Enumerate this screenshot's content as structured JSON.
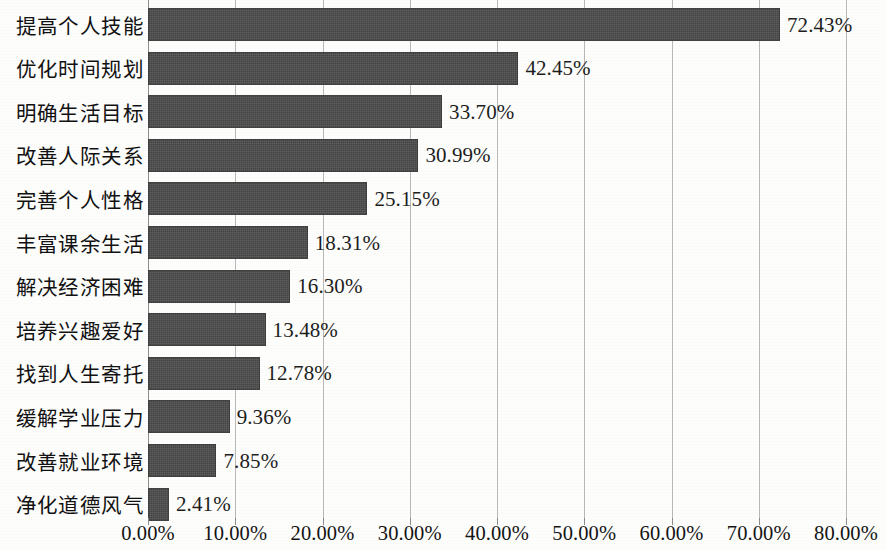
{
  "chart_data": {
    "type": "bar",
    "orientation": "horizontal",
    "title": "",
    "subtitle": "",
    "xlabel": "",
    "ylabel": "",
    "xlim": [
      0,
      80
    ],
    "grid": true,
    "legend": false,
    "legend_position": "none",
    "value_label_format": "0.00%",
    "bar_color": "#4b4b4b",
    "gridline_color": "#b9b9b9",
    "background_color": "#fdfdfc",
    "categories": [
      "提高个人技能",
      "优化时间规划",
      "明确生活目标",
      "改善人际关系",
      "完善个人性格",
      "丰富课余生活",
      "解决经济困难",
      "培养兴趣爱好",
      "找到人生寄托",
      "缓解学业压力",
      "改善就业环境",
      "净化道德风气"
    ],
    "values": [
      72.43,
      42.45,
      33.7,
      30.99,
      25.15,
      18.31,
      16.3,
      13.48,
      12.78,
      9.36,
      7.85,
      2.41
    ],
    "value_labels": [
      "72.43%",
      "42.45%",
      "33.70%",
      "30.99%",
      "25.15%",
      "18.31%",
      "16.30%",
      "13.48%",
      "12.78%",
      "9.36%",
      "7.85%",
      "2.41%"
    ],
    "x_ticks": [
      0,
      10,
      20,
      30,
      40,
      50,
      60,
      70,
      80
    ],
    "x_tick_labels": [
      "0.00%",
      "10.00%",
      "20.00%",
      "30.00%",
      "40.00%",
      "50.00%",
      "60.00%",
      "70.00%",
      "80.00%"
    ]
  }
}
